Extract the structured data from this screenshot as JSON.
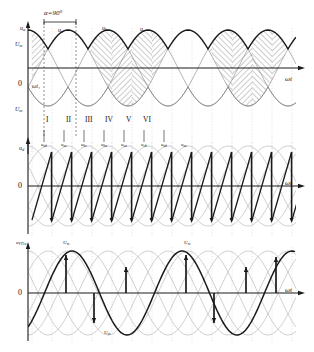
{
  "figure": {
    "type": "technical-waveform-diagram",
    "background_color": "#ffffff",
    "ink_color": "#1a1a1a",
    "light_ink_color": "#9a9a9a",
    "hatch_color": "#3a3a3a"
  },
  "annotations": {
    "alpha_label": "α=90°",
    "omega_t": "ωt",
    "omega_t1": "ωt₁",
    "zero": "0"
  },
  "panels": [
    {
      "id": "panel-top",
      "y_axis_label": "u",
      "y_axis_label_sub": "a",
      "y_positive_tick": "U",
      "y_positive_tick_sub": "m",
      "y_negative_tick": "U",
      "y_negative_tick_sub": "m",
      "x_axis_label": "ωt",
      "origin_label": "0",
      "wave_labels": [
        {
          "base": "u",
          "sub": "a",
          "x": 60,
          "y": 30
        },
        {
          "base": "u",
          "sub": "b",
          "x": 104,
          "y": 28
        },
        {
          "base": "u",
          "sub": "c",
          "x": 140,
          "y": 29
        }
      ],
      "intervals": [
        "I",
        "II",
        "III",
        "IV",
        "V",
        "VI"
      ],
      "alpha_bracket": {
        "label": "α=90°",
        "start_x": 44,
        "end_x": 76
      }
    },
    {
      "id": "panel-middle",
      "y_axis_label": "u",
      "y_axis_label_sub": "d",
      "x_axis_label": "ωt",
      "origin_label": "0",
      "wave_labels": [
        {
          "base": "u",
          "sub": "ab"
        },
        {
          "base": "u",
          "sub": "ac"
        },
        {
          "base": "u",
          "sub": "bc"
        },
        {
          "base": "u",
          "sub": "ba"
        },
        {
          "base": "u",
          "sub": "ca"
        },
        {
          "base": "u",
          "sub": "cb"
        },
        {
          "base": "u",
          "sub": "ab"
        },
        {
          "base": "u",
          "sub": "ac"
        }
      ]
    },
    {
      "id": "panel-bottom",
      "y_axis_label": "u",
      "y_axis_label_sub": "VT1a",
      "x_axis_label": "ωt",
      "origin_label": "0",
      "wave_labels": [
        {
          "base": "U",
          "sub": "m",
          "x": 66,
          "y": 240
        },
        {
          "base": "U",
          "sub": "m",
          "x": 186,
          "y": 240
        },
        {
          "base": "U",
          "sub": "m",
          "x": 108,
          "y": 332
        }
      ]
    }
  ],
  "chart_data": {
    "type": "line",
    "title": "",
    "xlabel": "ωt",
    "ylabel": "u",
    "grid": true,
    "legend": "none",
    "panels": [
      {
        "name": "three-phase source voltages with conduction hatching",
        "series": [
          {
            "name": "u_a",
            "phase_deg": 0,
            "amplitude": 1.0
          },
          {
            "name": "u_b",
            "phase_deg": 120,
            "amplitude": 1.0
          },
          {
            "name": "u_c",
            "phase_deg": 240,
            "amplitude": 1.0
          }
        ],
        "firing_angle_deg": 90,
        "intervals": [
          "I",
          "II",
          "III",
          "IV",
          "V",
          "VI"
        ],
        "xlim": [
          0,
          1080
        ],
        "ylim": [
          -1.15,
          1.15
        ]
      },
      {
        "name": "rectified output voltage u_d (sawtooth at alpha=90)",
        "series": [
          {
            "name": "u_d",
            "waveform": "sawtooth",
            "cycles": 14,
            "amplitude": 0.95
          }
        ],
        "xlim": [
          0,
          1080
        ],
        "ylim": [
          -1.15,
          1.15
        ]
      },
      {
        "name": "thyristor VT1 voltage u_VT1a",
        "series": [
          {
            "name": "u_VT1a",
            "waveform": "sine",
            "cycles": 2.5,
            "amplitude": 1.0
          }
        ],
        "xlim": [
          0,
          1080
        ],
        "ylim": [
          -1.15,
          1.15
        ]
      }
    ]
  }
}
